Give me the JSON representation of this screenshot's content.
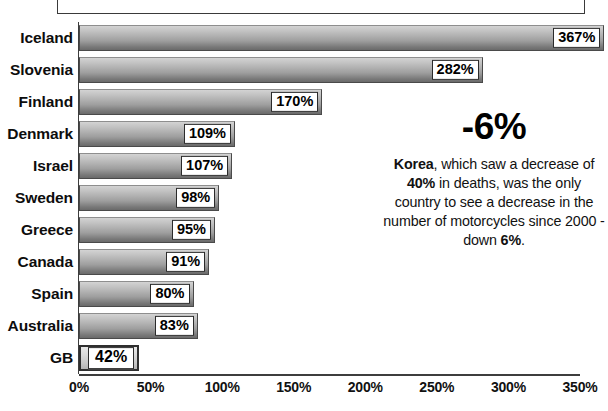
{
  "chart_data": {
    "type": "bar",
    "orientation": "horizontal",
    "title": "",
    "xlabel": "",
    "ylabel": "",
    "categories": [
      "Iceland",
      "Slovenia",
      "Finland",
      "Denmark",
      "Israel",
      "Sweden",
      "Greece",
      "Canada",
      "Spain",
      "Australia",
      "GB"
    ],
    "values": [
      367,
      282,
      170,
      109,
      107,
      98,
      95,
      91,
      80,
      83,
      42
    ],
    "value_labels": [
      "367%",
      "282%",
      "170%",
      "109%",
      "107%",
      "98%",
      "95%",
      "91%",
      "80%",
      "83%",
      "42%"
    ],
    "highlighted_category": "GB",
    "xlim": [
      0,
      350
    ],
    "xtick_values": [
      0,
      50,
      100,
      150,
      200,
      250,
      300,
      350
    ],
    "xtick_labels": [
      "0%",
      "50%",
      "100%",
      "150%",
      "200%",
      "250%",
      "300%",
      "350%"
    ],
    "grid": false,
    "legend": null,
    "units": "percent",
    "bar_color_light": "#d3d3d3",
    "bar_color_dark": "#6a6a6a",
    "highlight_bar_color": "#e7e7e7",
    "axis_color": "#3d3d3d",
    "text_color": "#0d0d0d",
    "annotation": {
      "headline": "-6%",
      "text": "Korea, which saw a decrease of 40% in deaths, was the only country to see a decrease in the number of motorcycles since 2000 - down 6%.",
      "bold_runs": [
        "Korea",
        "40%",
        "6%"
      ],
      "position": "right"
    }
  },
  "chart": {
    "bars": [
      {
        "label": "Iceland",
        "value": 367,
        "value_label": "367%",
        "highlight": false
      },
      {
        "label": "Slovenia",
        "value": 282,
        "value_label": "282%",
        "highlight": false
      },
      {
        "label": "Finland",
        "value": 170,
        "value_label": "170%",
        "highlight": false
      },
      {
        "label": "Denmark",
        "value": 109,
        "value_label": "109%",
        "highlight": false
      },
      {
        "label": "Israel",
        "value": 107,
        "value_label": "107%",
        "highlight": false
      },
      {
        "label": "Sweden",
        "value": 98,
        "value_label": "98%",
        "highlight": false
      },
      {
        "label": "Greece",
        "value": 95,
        "value_label": "95%",
        "highlight": false
      },
      {
        "label": "Canada",
        "value": 91,
        "value_label": "91%",
        "highlight": false
      },
      {
        "label": "Spain",
        "value": 80,
        "value_label": "80%",
        "highlight": false
      },
      {
        "label": "Australia",
        "value": 83,
        "value_label": "83%",
        "highlight": false
      },
      {
        "label": "GB",
        "value": 42,
        "value_label": "42%",
        "highlight": true
      }
    ],
    "xticks": [
      "0%",
      "50%",
      "100%",
      "150%",
      "200%",
      "250%",
      "300%",
      "350%"
    ]
  },
  "annotation": {
    "headline": "-6%",
    "line1_bold": "Korea",
    "line1_rest": ", which saw a decrease",
    "line2_pre": "of ",
    "line2_bold": "40%",
    "line2_rest": " in deaths, was the",
    "line3": "only country to see a decrease",
    "line4": "in the number of motorcycles",
    "line5_pre": "since 2000 - down ",
    "line5_bold": "6%",
    "line5_rest": "."
  }
}
